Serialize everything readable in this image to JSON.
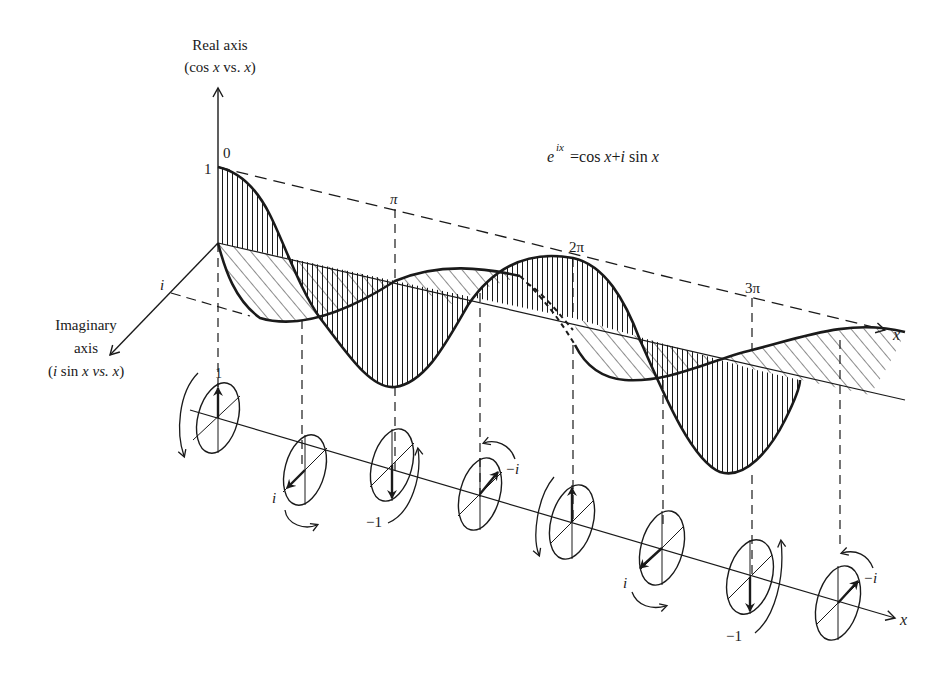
{
  "diagram": {
    "title_equation": {
      "base": "e",
      "exponent": "ix",
      "rhs": "= cos x + i sin x"
    },
    "real_axis": {
      "line1": "Real  axis",
      "line2": "(cos x vs. x)"
    },
    "imaginary_axis": {
      "line1": "Imaginary",
      "line2": "axis",
      "line3": "(i sin x vs. x)"
    },
    "labels": {
      "one": "1",
      "zero": "0",
      "i": "i",
      "pi": "π",
      "two_pi": "2π",
      "three_pi": "3π",
      "x_top": "x",
      "x_bottom": "x"
    },
    "phasors": [
      {
        "index": 0,
        "phase": "0",
        "value_label": "1",
        "arrow": "up"
      },
      {
        "index": 1,
        "phase": "π/2",
        "value_label": "i",
        "arrow": "down-left"
      },
      {
        "index": 2,
        "phase": "π",
        "value_label": "−1",
        "arrow": "down"
      },
      {
        "index": 3,
        "phase": "3π/2",
        "value_label": "−i",
        "arrow": "up-right"
      },
      {
        "index": 4,
        "phase": "2π",
        "value_label": "",
        "arrow": "up"
      },
      {
        "index": 5,
        "phase": "5π/2",
        "value_label": "i",
        "arrow": "down-left"
      },
      {
        "index": 6,
        "phase": "3π",
        "value_label": "−1",
        "arrow": "down"
      },
      {
        "index": 7,
        "phase": "7π/2",
        "value_label": "−i",
        "arrow": "up-right"
      }
    ],
    "phasor_labels": {
      "p1": "i",
      "p2": "−1",
      "p3": "−i",
      "p5": "i",
      "p6": "−1",
      "p7": "−i"
    },
    "colors": {
      "ink": "#1a1a1a",
      "background": "#ffffff"
    }
  }
}
